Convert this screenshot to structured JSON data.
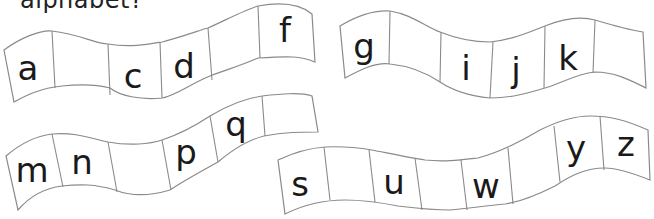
{
  "title": "alphabet?",
  "ribbons": [
    {
      "cells": [
        "a",
        "",
        "c",
        "d",
        "",
        "f"
      ]
    },
    {
      "cells": [
        "g",
        "",
        "i",
        "j",
        "k",
        ""
      ]
    },
    {
      "cells": [
        "m",
        "n",
        "",
        "p",
        "q",
        ""
      ]
    },
    {
      "cells": [
        "s",
        "",
        "u",
        "",
        "w",
        "",
        "y",
        "z"
      ]
    }
  ],
  "colors": {
    "stroke": "#8a8a8a",
    "text": "#1a1a1a",
    "background": "#ffffff"
  }
}
